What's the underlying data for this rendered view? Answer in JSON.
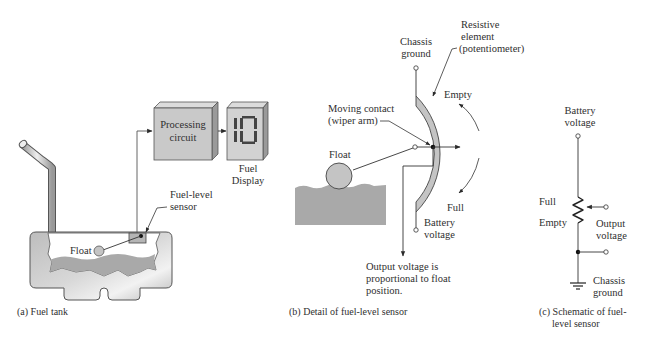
{
  "panel_a": {
    "caption": "(a)  Fuel tank",
    "processing_box": {
      "line1": "Processing",
      "line2": "circuit"
    },
    "display": {
      "value": "10",
      "label_line1": "Fuel",
      "label_line2": "Display"
    },
    "sensor_label": {
      "line1": "Fuel-level",
      "line2": "sensor"
    },
    "float_label": "Float"
  },
  "panel_b": {
    "caption": "(b)  Detail of fuel-level sensor",
    "chassis_ground": {
      "line1": "Chassis",
      "line2": "ground"
    },
    "resistive_element": {
      "line1": "Resistive",
      "line2": "element",
      "line3": "(potentiometer)"
    },
    "empty_label": "Empty",
    "full_label": "Full",
    "moving_contact": {
      "line1": "Moving contact",
      "line2": "(wiper arm)"
    },
    "float_label": "Float",
    "battery_voltage": {
      "line1": "Battery",
      "line2": "voltage"
    },
    "output_note": {
      "line1": "Output voltage is",
      "line2": "proportional to float",
      "line3": "position."
    }
  },
  "panel_c": {
    "caption": {
      "line1": "(c)  Schematic of fuel-",
      "line2": "level sensor"
    },
    "battery_voltage": {
      "line1": "Battery",
      "line2": "voltage"
    },
    "full_label": "Full",
    "empty_label": "Empty",
    "output_voltage": {
      "line1": "Output",
      "line2": "voltage"
    },
    "chassis_ground": {
      "line1": "Chassis",
      "line2": "ground"
    }
  },
  "colors": {
    "line": "#3a3a3a",
    "fill_gray": "#c4c4c4",
    "fuel_gray": "#a9a9a9",
    "box_face": "#c9c9c9",
    "box_side": "#9a9a9a",
    "box_top": "#dcdcdc"
  }
}
